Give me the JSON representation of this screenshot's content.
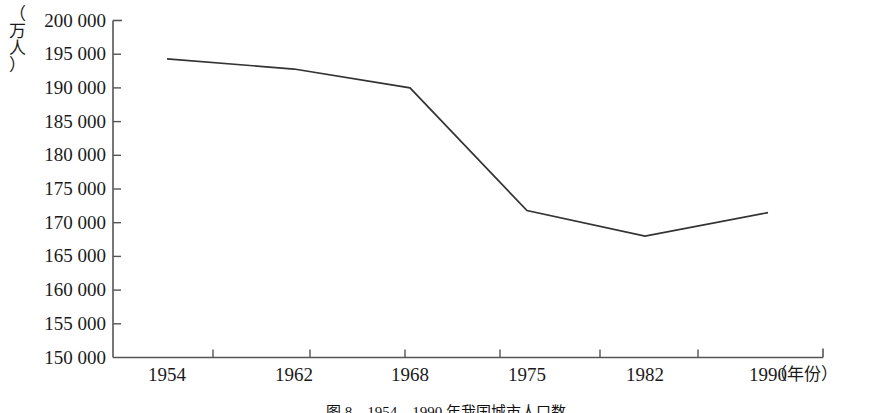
{
  "chart_data": {
    "type": "line",
    "title": "",
    "subtitle": "",
    "xlabel": "（年份）",
    "ylabel": "（万人）",
    "ylabel_chars": [
      "（",
      "万",
      "人",
      "）"
    ],
    "x": [
      1954,
      1962,
      1968,
      1975,
      1982,
      1990
    ],
    "categories": [
      "1954",
      "1962",
      "1968",
      "1975",
      "1982",
      "1990"
    ],
    "values": [
      194300,
      192800,
      190000,
      171800,
      168000,
      171500
    ],
    "series": [
      {
        "name": "人口数",
        "values": [
          194300,
          192800,
          190000,
          171800,
          168000,
          171500
        ]
      }
    ],
    "ylim": [
      150000,
      200000
    ],
    "ytick_step": 5000,
    "ytick_labels": [
      "200 000",
      "195 000",
      "190 000",
      "185 000",
      "180 000",
      "175 000",
      "170 000",
      "165 000",
      "160 000",
      "155 000",
      "150 000"
    ],
    "ytick_values": [
      200000,
      195000,
      190000,
      185000,
      180000,
      175000,
      170000,
      165000,
      160000,
      155000,
      150000
    ],
    "grid": false,
    "legend": false,
    "legend_position": "none",
    "line_color": "#333333",
    "axis_color": "#555555",
    "annotations": []
  },
  "caption": {
    "text": "图 8　1954—1990 年我国城市人口数"
  }
}
